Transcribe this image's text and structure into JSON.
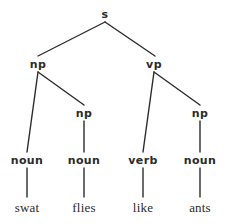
{
  "figure": {
    "kind": "constituency-parse-tree",
    "sentence": "swat flies like ants",
    "background_color": "#ffffff",
    "ink_color": "#2b2b2b",
    "width": 226,
    "height": 223
  },
  "nodes": {
    "root": {
      "label": "s",
      "x": 105,
      "y": 14,
      "type": "nonterminal"
    },
    "np_subject": {
      "label": "np",
      "x": 38,
      "y": 64,
      "type": "nonterminal"
    },
    "vp_predicate": {
      "label": "vp",
      "x": 154,
      "y": 64,
      "type": "nonterminal"
    },
    "np_object_left": {
      "label": "np",
      "x": 84,
      "y": 113,
      "type": "nonterminal"
    },
    "np_object_right": {
      "label": "np",
      "x": 200,
      "y": 113,
      "type": "nonterminal"
    },
    "pos_noun_1": {
      "label": "noun",
      "x": 27,
      "y": 160,
      "type": "nonterminal"
    },
    "pos_noun_2": {
      "label": "noun",
      "x": 84,
      "y": 160,
      "type": "nonterminal"
    },
    "pos_verb": {
      "label": "verb",
      "x": 143,
      "y": 160,
      "type": "nonterminal"
    },
    "pos_noun_3": {
      "label": "noun",
      "x": 200,
      "y": 160,
      "type": "nonterminal"
    },
    "word_swat": {
      "label": "swat",
      "x": 27,
      "y": 207,
      "type": "terminal"
    },
    "word_flies": {
      "label": "flies",
      "x": 84,
      "y": 207,
      "type": "terminal"
    },
    "word_like": {
      "label": "like",
      "x": 143,
      "y": 207,
      "type": "terminal"
    },
    "word_ants": {
      "label": "ants",
      "x": 200,
      "y": 207,
      "type": "terminal"
    }
  },
  "edges": [
    {
      "name": "edge-s-to-np",
      "x1": 105,
      "y1": 22,
      "x2": 38,
      "y2": 56
    },
    {
      "name": "edge-s-to-vp",
      "x1": 105,
      "y1": 22,
      "x2": 155,
      "y2": 56
    },
    {
      "name": "edge-np-to-noun1",
      "x1": 38,
      "y1": 72,
      "x2": 27,
      "y2": 152
    },
    {
      "name": "edge-np-to-np",
      "x1": 38,
      "y1": 72,
      "x2": 84,
      "y2": 105
    },
    {
      "name": "edge-innernp-to-noun2",
      "x1": 84,
      "y1": 121,
      "x2": 84,
      "y2": 152
    },
    {
      "name": "edge-vp-to-verb",
      "x1": 154,
      "y1": 72,
      "x2": 143,
      "y2": 152
    },
    {
      "name": "edge-vp-to-np",
      "x1": 154,
      "y1": 72,
      "x2": 200,
      "y2": 105
    },
    {
      "name": "edge-innernp-to-noun3",
      "x1": 200,
      "y1": 121,
      "x2": 200,
      "y2": 152
    },
    {
      "name": "edge-noun1-to-swat",
      "x1": 27,
      "y1": 168,
      "x2": 27,
      "y2": 197
    },
    {
      "name": "edge-noun2-to-flies",
      "x1": 84,
      "y1": 168,
      "x2": 84,
      "y2": 197
    },
    {
      "name": "edge-verb-to-like",
      "x1": 143,
      "y1": 168,
      "x2": 143,
      "y2": 197
    },
    {
      "name": "edge-noun3-to-ants",
      "x1": 200,
      "y1": 168,
      "x2": 200,
      "y2": 197
    }
  ]
}
